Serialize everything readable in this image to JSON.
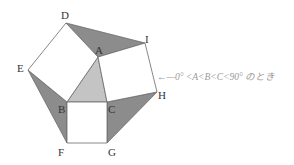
{
  "figure": {
    "type": "geometry",
    "vertices": {
      "A": [
        98,
        57
      ],
      "B": [
        67,
        102
      ],
      "C": [
        107,
        102
      ],
      "D": [
        66,
        23
      ],
      "E": [
        28,
        70
      ],
      "F": [
        67,
        143
      ],
      "G": [
        107,
        143
      ],
      "H": [
        157,
        92
      ],
      "I": [
        145,
        43
      ]
    },
    "labels": {
      "A": "A",
      "B": "B",
      "C": "C",
      "D": "D",
      "E": "E",
      "F": "F",
      "G": "G",
      "H": "H",
      "I": "I"
    },
    "annotation": "←—0° <A<B<C<90° のとき",
    "colors": {
      "stroke": "#6a6a6a",
      "dark_fill": "#8c8c8c",
      "light_fill": "#c4c4c4",
      "square_fill": "#ffffff",
      "annotation": "#9a9a9a"
    }
  }
}
